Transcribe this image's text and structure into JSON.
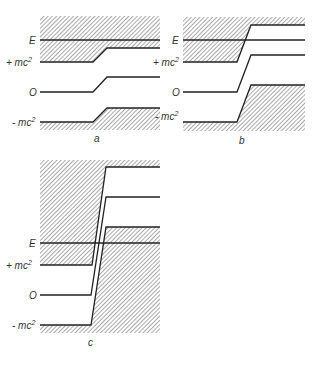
{
  "panels": [
    {
      "id": "a",
      "caption": "a",
      "labels": {
        "E": "E",
        "plus_mc2": "+ mc",
        "zero": "O",
        "minus_mc2": "- mc",
        "sup": "2"
      }
    },
    {
      "id": "b",
      "caption": "b",
      "labels": {
        "E": "E",
        "plus_mc2": "+ mc",
        "zero": "O",
        "minus_mc2": "- mc",
        "sup": "2"
      }
    },
    {
      "id": "c",
      "caption": "c",
      "labels": {
        "E": "E",
        "plus_mc2": "+ mc",
        "zero": "O",
        "minus_mc2": "- mc",
        "sup": "2"
      }
    }
  ],
  "colors": {
    "line": "#222222",
    "hatch": "#555555",
    "background": "#ffffff"
  }
}
